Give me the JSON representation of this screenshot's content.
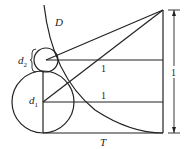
{
  "diagram": {
    "labels": {
      "curve": "D",
      "small_circle": "d",
      "small_circle_sub": "2",
      "big_circle": "d",
      "big_circle_sub": "1",
      "upper_segment": "1",
      "lower_segment": "1",
      "height_dimension": "1",
      "base": "T"
    },
    "colors": {
      "stroke": "#222222",
      "background": "#ffffff"
    }
  }
}
